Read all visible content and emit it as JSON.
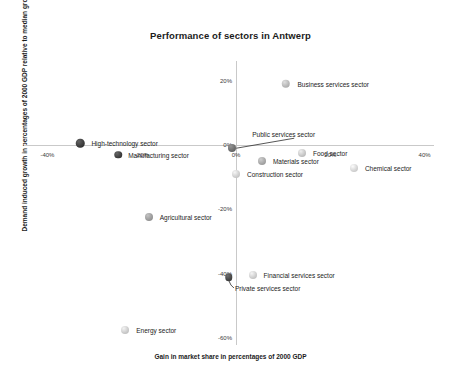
{
  "chart_data": {
    "type": "scatter",
    "title": "Performance of sectors in Antwerp",
    "xlabel": "Gain in market share in percentages of 2000 GDP",
    "ylabel": "Demand induced growth in percentages of 2000 GDP relative to median growth",
    "xlim": [
      -45,
      42
    ],
    "ylim": [
      -62,
      26
    ],
    "xticks": [
      "-40%",
      "-20%",
      "0%",
      "20%",
      "40%"
    ],
    "xtickvals": [
      -40,
      -20,
      0,
      20,
      40
    ],
    "yticks": [
      "20%",
      "0%",
      "-20%",
      "-40%",
      "-60%"
    ],
    "ytickvals": [
      20,
      0,
      -20,
      -40,
      -60
    ],
    "grid": false,
    "legend": "none",
    "axis_color": "#c9c9c9",
    "points": [
      {
        "label": "Business services sector",
        "x": 10.5,
        "y": 19.0,
        "size": 8.5,
        "shade": "#b9b9b9",
        "label_dx": 12,
        "label_dy": 0
      },
      {
        "label": "High-technology sector",
        "x": -33.0,
        "y": 0.5,
        "size": 8.5,
        "shade": "#3d3d3d",
        "label_dx": 11,
        "label_dy": 0
      },
      {
        "label": "Manufacturing sector",
        "x": -25.0,
        "y": -3.0,
        "size": 7.5,
        "shade": "#414141",
        "label_dx": 10,
        "label_dy": 0
      },
      {
        "label": "Public services sector",
        "x": -0.8,
        "y": -1.0,
        "size": 8.0,
        "shade": "#6e6e6e",
        "label_dx": 20,
        "label_dy": -14,
        "leader": true
      },
      {
        "label": "Food sector",
        "x": 14.0,
        "y": -2.5,
        "size": 8.0,
        "shade": "#c8c8c8",
        "label_dx": 11,
        "label_dy": 0
      },
      {
        "label": "Materials sector",
        "x": 5.5,
        "y": -5.0,
        "size": 8.0,
        "shade": "#a8a8a8",
        "label_dx": 11,
        "label_dy": 0
      },
      {
        "label": "Chemical sector",
        "x": 25.0,
        "y": -7.0,
        "size": 8.0,
        "shade": "#d6d6d6",
        "label_dx": 11,
        "label_dy": 0
      },
      {
        "label": "Construction sector",
        "x": 0.0,
        "y": -9.0,
        "size": 8.0,
        "shade": "#d0d0d0",
        "label_dx": 11,
        "label_dy": 0
      },
      {
        "label": "Agricultural sector",
        "x": -18.5,
        "y": -22.5,
        "size": 8.0,
        "shade": "#9d9d9d",
        "label_dx": 11,
        "label_dy": 0
      },
      {
        "label": "Financial services sector",
        "x": 3.5,
        "y": -40.5,
        "size": 8.0,
        "shade": "#cfcfcf",
        "label_dx": 11,
        "label_dy": 0
      },
      {
        "label": "Private services sector",
        "x": -1.5,
        "y": -41.0,
        "size": 7.5,
        "shade": "#484848",
        "label_dx": 6,
        "label_dy": 11,
        "leader2": true
      },
      {
        "label": "Energy sector",
        "x": -23.5,
        "y": -57.5,
        "size": 8.0,
        "shade": "#cdcdcd",
        "label_dx": 11,
        "label_dy": 0
      }
    ]
  }
}
